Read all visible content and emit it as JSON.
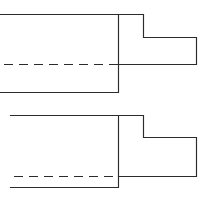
{
  "document": {
    "title": "Stepped Shaft Cross-Section Drawing",
    "type": "diagram",
    "background_color": "#ffffff",
    "line_color": "#2b2b2b",
    "width": 206,
    "height": 202
  },
  "figures": [
    {
      "id": "figure-top",
      "name": "upper-stepped-shaft",
      "description": "Upper half-section of a stepped cylindrical shaft with centerline",
      "centerline": {
        "name": "centerline-upper",
        "y": 64.5,
        "x_start": 4,
        "x_end": 150,
        "dash_pattern": "9 6"
      },
      "outline_points": "0,14.5 118.5,14.5 118.5,92.5 0,92.5",
      "step_points": "118.5,14.5 143.5,14.5 143.5,37.5 196.5,37.5 196.5,64.5 118.5,64.5",
      "dimensions": {
        "large_body_top_y": 14.5,
        "large_body_bottom_y": 92.5,
        "shoulder_x": 118.5,
        "boss_right_x": 143.5,
        "step_top_y": 37.5,
        "tip_right_x": 196.5,
        "tip_bottom_y": 64.5,
        "left_open_edge_x": 0
      }
    },
    {
      "id": "figure-bottom",
      "name": "lower-stepped-shaft",
      "description": "Lower half-section of a stepped cylindrical shaft with centerline",
      "centerline": {
        "name": "centerline-lower",
        "y": 176.5,
        "x_start": 14,
        "x_end": 150,
        "dash_pattern": "9 6"
      },
      "outline_points": "10.5,115.5 118.5,115.5 118.5,187.5 10.5,187.5",
      "step_points": "118.5,115.5 143.5,115.5 143.5,137.5 196.5,137.5 196.5,176.5 118.5,176.5",
      "dimensions": {
        "large_body_top_y": 115.5,
        "large_body_bottom_y": 187.5,
        "shoulder_x": 118.5,
        "boss_right_x": 143.5,
        "step_top_y": 137.5,
        "tip_right_x": 196.5,
        "tip_bottom_y": 176.5,
        "left_open_edge_x": 10.5
      }
    }
  ]
}
